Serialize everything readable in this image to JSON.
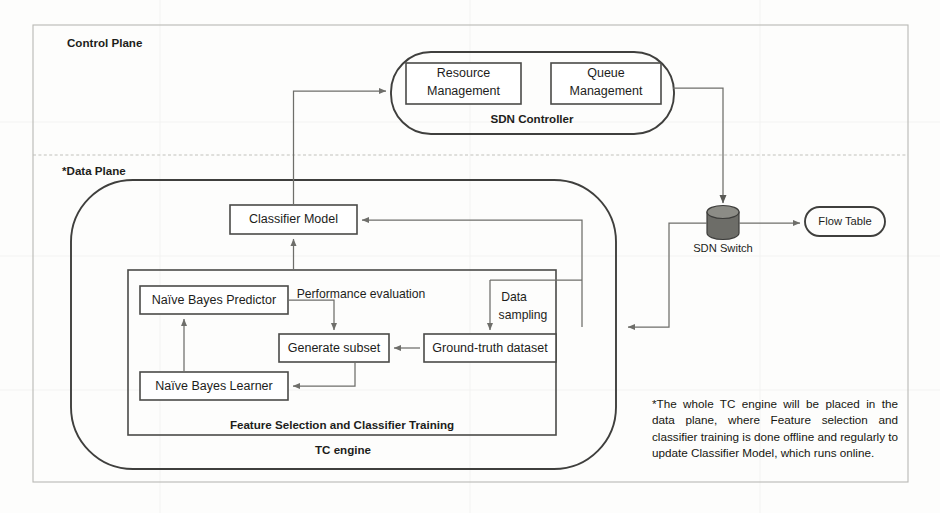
{
  "planes": {
    "control": {
      "label": "Control Plane"
    },
    "data": {
      "label": "*Data Plane"
    }
  },
  "controller": {
    "title": "SDN Controller",
    "modules": [
      {
        "id": "resource-management",
        "line1": "Resource",
        "line2": "Management"
      },
      {
        "id": "queue-management",
        "line1": "Queue",
        "line2": "Management"
      }
    ]
  },
  "tc_engine": {
    "label": "TC engine",
    "classifier_model": "Classifier Model",
    "training_group": {
      "label": "Feature Selection and Classifier Training",
      "nodes": [
        {
          "id": "naive-bayes-predictor",
          "label": "Naïve Bayes Predictor"
        },
        {
          "id": "naive-bayes-learner",
          "label": "Naïve Bayes Learner"
        },
        {
          "id": "generate-subset",
          "label": "Generate subset"
        },
        {
          "id": "ground-truth-dataset",
          "label": "Ground-truth dataset"
        }
      ]
    }
  },
  "network": {
    "sdn_switch": "SDN Switch",
    "flow_table": "Flow Table"
  },
  "edge_labels": {
    "performance_evaluation": "Performance evaluation",
    "data_sampling_line1": "Data",
    "data_sampling_line2": "sampling"
  },
  "footnote": "*The whole TC engine will be placed in the data plane, where Feature selection and classifier training is done offline and regularly to update Classifier Model, which runs online.",
  "colors": {
    "node_stroke": "#4a4a48",
    "plane_stroke": "#b9b9b4",
    "connector": "#6e6e6a",
    "switch_fill": "#6d6d68",
    "text": "#1d1d1b",
    "background": "#fdfdfc"
  }
}
